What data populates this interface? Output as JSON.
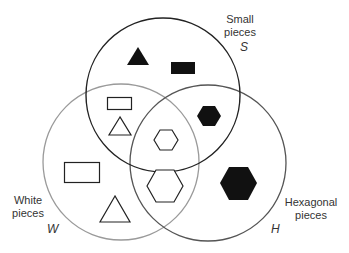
{
  "diagram": {
    "type": "venn",
    "sets": [
      {
        "id": "S",
        "name_line1": "Small",
        "name_line2": "pieces",
        "letter": "S",
        "stroke": "#222222"
      },
      {
        "id": "W",
        "name_line1": "White",
        "name_line2": "pieces",
        "letter": "W",
        "stroke": "#9a9a9a"
      },
      {
        "id": "H",
        "name_line1": "Hexagonal",
        "name_line2": "pieces",
        "letter": "H",
        "stroke": "#555555"
      }
    ],
    "regions": [
      {
        "sets": [
          "S"
        ],
        "pieces": [
          "small black triangle",
          "small black rectangle"
        ]
      },
      {
        "sets": [
          "S",
          "W"
        ],
        "pieces": [
          "small white rectangle",
          "small white triangle"
        ]
      },
      {
        "sets": [
          "S",
          "H"
        ],
        "pieces": [
          "small black hexagon"
        ]
      },
      {
        "sets": [
          "S",
          "W",
          "H"
        ],
        "pieces": [
          "small white hexagon"
        ]
      },
      {
        "sets": [
          "W"
        ],
        "pieces": [
          "large white rectangle",
          "large white triangle"
        ]
      },
      {
        "sets": [
          "W",
          "H"
        ],
        "pieces": [
          "large white hexagon"
        ]
      },
      {
        "sets": [
          "H"
        ],
        "pieces": [
          "large black hexagon"
        ]
      }
    ],
    "colors": {
      "black_fill": "#111111",
      "white_fill": "#ffffff",
      "outline": "#222222"
    }
  }
}
